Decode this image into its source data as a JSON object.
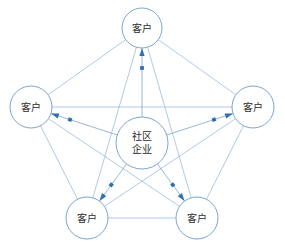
{
  "diagram": {
    "type": "radial-network-pentagon",
    "colors": {
      "node_stroke": "#7ba7d0",
      "node_fill": "#ffffff",
      "link_line": "#8fb3d9",
      "flow_line": "#7ba7d0",
      "flow_marker": "#2f6fb5",
      "label_text": "#2b2b2b",
      "background": "#ffffff"
    },
    "center_node": {
      "id": "center",
      "label_line1": "社区",
      "label_line2": "企业",
      "cx": 142,
      "cy": 143,
      "r": 26
    },
    "customer_nodes": [
      {
        "id": "top",
        "label": "客户",
        "cx": 142,
        "cy": 28,
        "r": 20
      },
      {
        "id": "left",
        "label": "客户",
        "cx": 31,
        "cy": 107,
        "r": 21
      },
      {
        "id": "right",
        "label": "客户",
        "cx": 253,
        "cy": 107,
        "r": 21
      },
      {
        "id": "bottom-left",
        "label": "客户",
        "cx": 87,
        "cy": 218,
        "r": 21
      },
      {
        "id": "bottom-right",
        "label": "客户",
        "cx": 197,
        "cy": 218,
        "r": 21
      }
    ],
    "peer_links": [
      {
        "from": "top",
        "to": "left"
      },
      {
        "from": "top",
        "to": "right"
      },
      {
        "from": "left",
        "to": "bottom-left"
      },
      {
        "from": "right",
        "to": "bottom-right"
      },
      {
        "from": "bottom-left",
        "to": "bottom-right"
      },
      {
        "from": "top",
        "to": "bottom-left"
      },
      {
        "from": "top",
        "to": "bottom-right"
      },
      {
        "from": "left",
        "to": "right"
      },
      {
        "from": "left",
        "to": "bottom-right"
      },
      {
        "from": "right",
        "to": "bottom-left"
      }
    ],
    "flows": [
      {
        "from": "center",
        "to": "top",
        "label": ""
      },
      {
        "from": "center",
        "to": "left",
        "label": ""
      },
      {
        "from": "center",
        "to": "right",
        "label": ""
      },
      {
        "from": "center",
        "to": "bottom-left",
        "label": ""
      },
      {
        "from": "center",
        "to": "bottom-right",
        "label": ""
      }
    ]
  }
}
